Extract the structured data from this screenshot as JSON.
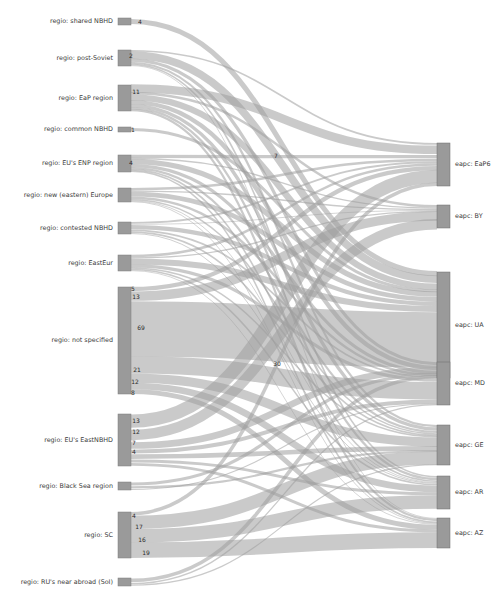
{
  "figure": {
    "type": "sankey",
    "title": "",
    "width": 502,
    "height": 602,
    "background": "#ffffff",
    "node_color": "#9a9a9a",
    "link_color": "#9e9e9e",
    "label_color": "#3b3b3b"
  },
  "chart_data": {
    "type": "sankey",
    "title": "",
    "xlabel": "",
    "ylabel": "",
    "legend": [],
    "grid": false,
    "nodes_left": [
      {
        "id": "shared_nbhd",
        "label": "regio: shared NBHD",
        "total": 4
      },
      {
        "id": "post_soviet",
        "label": "regio: post-Soviet",
        "total": 22
      },
      {
        "id": "eap_region",
        "label": "regio: EaP region",
        "total": 41
      },
      {
        "id": "common_nbhd",
        "label": "regio: common NBHD",
        "total": 1
      },
      {
        "id": "eu_enp_region",
        "label": "regio: EU's ENP region",
        "total": 24
      },
      {
        "id": "new_east_eur",
        "label": "regio: new (eastern) Europe",
        "total": 18
      },
      {
        "id": "contested_nbhd",
        "label": "regio: contested NBHD",
        "total": 13
      },
      {
        "id": "easteur",
        "label": "regio: EastEur",
        "total": 22
      },
      {
        "id": "not_specified",
        "label": "regio: not specified",
        "total": 134
      },
      {
        "id": "eu_eastnbhd",
        "label": "regio: EU's EastNBHD",
        "total": 47
      },
      {
        "id": "black_sea",
        "label": "regio: Black Sea region",
        "total": 6
      },
      {
        "id": "sc",
        "label": "regio: SC",
        "total": 58
      },
      {
        "id": "ru_near_abroad",
        "label": "regio: RU's near abroad (SoI)",
        "total": 5
      }
    ],
    "nodes_right": [
      {
        "id": "eap6",
        "label": "eapc: EaP6",
        "total": 47
      },
      {
        "id": "by",
        "label": "eapc: BY",
        "total": 22
      },
      {
        "id": "ua",
        "label": "eapc: UA",
        "total": 121
      },
      {
        "id": "md",
        "label": "eapc: MD",
        "total": 45
      },
      {
        "id": "ge",
        "label": "eapc: GE",
        "total": 42
      },
      {
        "id": "ar",
        "label": "eapc: AR",
        "total": 34
      },
      {
        "id": "az",
        "label": "eapc: AZ",
        "total": 30
      }
    ],
    "links": [
      {
        "source": "shared_nbhd",
        "target": "ua",
        "value": 4,
        "label": "4"
      },
      {
        "source": "post_soviet",
        "target": "eap6",
        "value": 2,
        "label": "2"
      },
      {
        "source": "post_soviet",
        "target": "ua",
        "value": 10,
        "label": ""
      },
      {
        "source": "post_soviet",
        "target": "md",
        "value": 4,
        "label": ""
      },
      {
        "source": "post_soviet",
        "target": "ge",
        "value": 3,
        "label": ""
      },
      {
        "source": "post_soviet",
        "target": "ar",
        "value": 2,
        "label": ""
      },
      {
        "source": "post_soviet",
        "target": "az",
        "value": 1,
        "label": ""
      },
      {
        "source": "eap_region",
        "target": "eap6",
        "value": 11,
        "label": "11"
      },
      {
        "source": "eap_region",
        "target": "by",
        "value": 4,
        "label": ""
      },
      {
        "source": "eap_region",
        "target": "ua",
        "value": 9,
        "label": ""
      },
      {
        "source": "eap_region",
        "target": "md",
        "value": 6,
        "label": ""
      },
      {
        "source": "eap_region",
        "target": "ge",
        "value": 5,
        "label": ""
      },
      {
        "source": "eap_region",
        "target": "ar",
        "value": 3,
        "label": ""
      },
      {
        "source": "eap_region",
        "target": "az",
        "value": 3,
        "label": ""
      },
      {
        "source": "common_nbhd",
        "target": "ua",
        "value": 1,
        "label": "1"
      },
      {
        "source": "eu_enp_region",
        "target": "eap6",
        "value": 4,
        "label": "4"
      },
      {
        "source": "eu_enp_region",
        "target": "by",
        "value": 2,
        "label": ""
      },
      {
        "source": "eu_enp_region",
        "target": "ua",
        "value": 7,
        "label": "7"
      },
      {
        "source": "eu_enp_region",
        "target": "md",
        "value": 4,
        "label": ""
      },
      {
        "source": "eu_enp_region",
        "target": "ge",
        "value": 3,
        "label": ""
      },
      {
        "source": "eu_enp_region",
        "target": "ar",
        "value": 2,
        "label": ""
      },
      {
        "source": "eu_enp_region",
        "target": "az",
        "value": 2,
        "label": ""
      },
      {
        "source": "new_east_eur",
        "target": "eap6",
        "value": 3,
        "label": ""
      },
      {
        "source": "new_east_eur",
        "target": "by",
        "value": 2,
        "label": ""
      },
      {
        "source": "new_east_eur",
        "target": "ua",
        "value": 6,
        "label": ""
      },
      {
        "source": "new_east_eur",
        "target": "md",
        "value": 3,
        "label": ""
      },
      {
        "source": "new_east_eur",
        "target": "ge",
        "value": 2,
        "label": ""
      },
      {
        "source": "new_east_eur",
        "target": "ar",
        "value": 1,
        "label": ""
      },
      {
        "source": "new_east_eur",
        "target": "az",
        "value": 1,
        "label": ""
      },
      {
        "source": "contested_nbhd",
        "target": "eap6",
        "value": 2,
        "label": ""
      },
      {
        "source": "contested_nbhd",
        "target": "by",
        "value": 1,
        "label": ""
      },
      {
        "source": "contested_nbhd",
        "target": "ua",
        "value": 5,
        "label": ""
      },
      {
        "source": "contested_nbhd",
        "target": "md",
        "value": 2,
        "label": ""
      },
      {
        "source": "contested_nbhd",
        "target": "ge",
        "value": 2,
        "label": ""
      },
      {
        "source": "contested_nbhd",
        "target": "ar",
        "value": 1,
        "label": ""
      },
      {
        "source": "easteur",
        "target": "eap6",
        "value": 3,
        "label": ""
      },
      {
        "source": "easteur",
        "target": "by",
        "value": 2,
        "label": ""
      },
      {
        "source": "easteur",
        "target": "ua",
        "value": 8,
        "label": ""
      },
      {
        "source": "easteur",
        "target": "md",
        "value": 4,
        "label": ""
      },
      {
        "source": "easteur",
        "target": "ge",
        "value": 2,
        "label": ""
      },
      {
        "source": "easteur",
        "target": "ar",
        "value": 2,
        "label": ""
      },
      {
        "source": "easteur",
        "target": "az",
        "value": 1,
        "label": ""
      },
      {
        "source": "not_specified",
        "target": "eap6",
        "value": 5,
        "label": "5"
      },
      {
        "source": "not_specified",
        "target": "by",
        "value": 13,
        "label": "13"
      },
      {
        "source": "not_specified",
        "target": "ua",
        "value": 69,
        "label": "69"
      },
      {
        "source": "not_specified",
        "target": "md",
        "value": 21,
        "label": "21"
      },
      {
        "source": "not_specified",
        "target": "ge",
        "value": 12,
        "label": "12"
      },
      {
        "source": "not_specified",
        "target": "ar",
        "value": 8,
        "label": "8"
      },
      {
        "source": "not_specified",
        "target": "az",
        "value": 6,
        "label": ""
      },
      {
        "source": "eu_eastnbhd",
        "target": "eap6",
        "value": 13,
        "label": "13"
      },
      {
        "source": "eu_eastnbhd",
        "target": "by",
        "value": 12,
        "label": "12"
      },
      {
        "source": "eu_eastnbhd",
        "target": "ua",
        "value": 7,
        "label": "7"
      },
      {
        "source": "eu_eastnbhd",
        "target": "md",
        "value": 4,
        "label": "4"
      },
      {
        "source": "eu_eastnbhd",
        "target": "ge",
        "value": 5,
        "label": ""
      },
      {
        "source": "eu_eastnbhd",
        "target": "ar",
        "value": 3,
        "label": ""
      },
      {
        "source": "eu_eastnbhd",
        "target": "az",
        "value": 3,
        "label": ""
      },
      {
        "source": "black_sea",
        "target": "ua",
        "value": 3,
        "label": ""
      },
      {
        "source": "black_sea",
        "target": "ge",
        "value": 2,
        "label": ""
      },
      {
        "source": "black_sea",
        "target": "md",
        "value": 1,
        "label": ""
      },
      {
        "source": "sc",
        "target": "eap6",
        "value": 4,
        "label": "4"
      },
      {
        "source": "sc",
        "target": "ge",
        "value": 17,
        "label": "17"
      },
      {
        "source": "sc",
        "target": "ar",
        "value": 16,
        "label": "16"
      },
      {
        "source": "sc",
        "target": "az",
        "value": 19,
        "label": "19"
      },
      {
        "source": "ru_near_abroad",
        "target": "ua",
        "value": 3,
        "label": ""
      },
      {
        "source": "ru_near_abroad",
        "target": "md",
        "value": 1,
        "label": ""
      },
      {
        "source": "ru_near_abroad",
        "target": "ge",
        "value": 1,
        "label": ""
      },
      {
        "source": "not_specified",
        "target": "md",
        "value": 30,
        "label": "30",
        "annotation_only": true
      }
    ],
    "annotations": [
      {
        "text": "4",
        "x": 140,
        "y": 22
      },
      {
        "text": "2",
        "x": 131,
        "y": 56
      },
      {
        "text": "11",
        "x": 136,
        "y": 92
      },
      {
        "text": "1",
        "x": 133,
        "y": 130
      },
      {
        "text": "4",
        "x": 131,
        "y": 163
      },
      {
        "text": "7",
        "x": 276,
        "y": 156
      },
      {
        "text": "5",
        "x": 133,
        "y": 289
      },
      {
        "text": "13",
        "x": 136,
        "y": 297
      },
      {
        "text": "69",
        "x": 141,
        "y": 328
      },
      {
        "text": "21",
        "x": 137,
        "y": 370
      },
      {
        "text": "12",
        "x": 135,
        "y": 382
      },
      {
        "text": "8",
        "x": 133,
        "y": 393
      },
      {
        "text": "30",
        "x": 277,
        "y": 364
      },
      {
        "text": "13",
        "x": 136,
        "y": 421
      },
      {
        "text": "12",
        "x": 136,
        "y": 432
      },
      {
        "text": "7",
        "x": 134,
        "y": 443
      },
      {
        "text": "4",
        "x": 134,
        "y": 452
      },
      {
        "text": "4",
        "x": 134,
        "y": 516
      },
      {
        "text": "17",
        "x": 139,
        "y": 527
      },
      {
        "text": "16",
        "x": 142,
        "y": 540
      },
      {
        "text": "19",
        "x": 146,
        "y": 553
      }
    ]
  }
}
